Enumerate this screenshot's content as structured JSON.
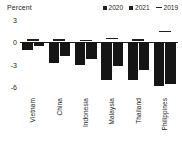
{
  "chart_data": {
    "type": "bar",
    "title": "",
    "ylabel": "Percent",
    "xlabel": "",
    "categories": [
      "Vietnam",
      "China",
      "Indonesia",
      "Malaysia",
      "Thailand",
      "Philippines"
    ],
    "series": [
      {
        "name": "2020",
        "values": [
          -1.0,
          -2.8,
          -3.1,
          -5.0,
          -5.1,
          -5.9
        ]
      },
      {
        "name": "2021",
        "values": [
          -0.5,
          -1.8,
          -2.3,
          -3.2,
          -3.7,
          -5.6
        ]
      },
      {
        "name": "2019",
        "values": [
          0.35,
          0.4,
          0.3,
          0.55,
          0.35,
          1.5
        ]
      }
    ],
    "legend": [
      "2020",
      "2021",
      "2019"
    ],
    "legend_position": "top-right",
    "yticks": [
      3,
      0,
      -3,
      -6
    ],
    "ytick_labels": [
      "3",
      "0",
      "-3",
      "-6"
    ],
    "ylim": [
      -7.2,
      3.2
    ],
    "grid": false,
    "zero_line": true,
    "marker_2019": "dash"
  },
  "colors": {
    "bar": "#151515",
    "text": "#231f20",
    "axis": "#231f20",
    "background": "#ffffff"
  }
}
